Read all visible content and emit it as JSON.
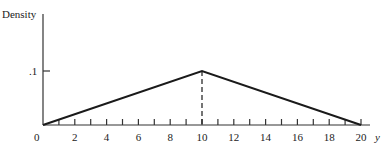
{
  "chart_data": {
    "type": "line",
    "title": "",
    "xlabel": "y",
    "ylabel": "Density",
    "x": [
      0,
      10,
      20
    ],
    "series": [
      {
        "name": "triangular density",
        "values": [
          0,
          0.1,
          0
        ]
      }
    ],
    "x_ticks_minor": [
      1,
      2,
      3,
      4,
      5,
      6,
      7,
      8,
      9,
      10,
      11,
      12,
      13,
      14,
      15,
      16,
      17,
      18,
      19,
      20
    ],
    "x_tick_labels": [
      "0",
      "2",
      "4",
      "6",
      "8",
      "10",
      "12",
      "14",
      "16",
      "18",
      "20"
    ],
    "y_tick_labels": [
      ".1"
    ],
    "y_ticks": [
      0.1
    ],
    "xlim": [
      0,
      20
    ],
    "ylim": [
      0,
      0.19
    ],
    "annotations": [
      {
        "type": "dashed-vertical-line",
        "x": 10,
        "from_y": 0,
        "to_y": 0.1
      }
    ],
    "grid": false,
    "legend": "none"
  },
  "labels": {
    "ylabel": "Density",
    "xlabel": "y",
    "origin": "0",
    "ytick": ".1"
  },
  "colors": {
    "line": "#1a1a1a",
    "axis": "#333333"
  }
}
